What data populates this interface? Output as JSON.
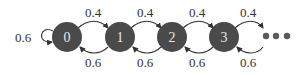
{
  "diagram": {
    "type": "markov-chain",
    "colors": {
      "node_fill": "#4a4a4a",
      "node_text": "#e8e8e8",
      "edge": "#333333",
      "label": "#333333"
    },
    "nodes": [
      {
        "id": "0",
        "label": "0",
        "cx": 67
      },
      {
        "id": "1",
        "label": "1",
        "cx": 120
      },
      {
        "id": "2",
        "label": "2",
        "cx": 172
      },
      {
        "id": "3",
        "label": "3",
        "cx": 224
      }
    ],
    "self_loop": {
      "node": "0",
      "label": "0.6"
    },
    "forward_edges": [
      {
        "from": "0",
        "to": "1",
        "label": "0.4"
      },
      {
        "from": "1",
        "to": "2",
        "label": "0.4"
      },
      {
        "from": "2",
        "to": "3",
        "label": "0.4"
      },
      {
        "from": "3",
        "to": "...",
        "label": "0.4"
      }
    ],
    "backward_edges": [
      {
        "from": "1",
        "to": "0",
        "label": "0.6"
      },
      {
        "from": "2",
        "to": "1",
        "label": "0.6"
      },
      {
        "from": "3",
        "to": "2",
        "label": "0.6"
      },
      {
        "from": "...",
        "to": "3",
        "label": "0.6"
      }
    ],
    "continuation": "ellipsis"
  }
}
